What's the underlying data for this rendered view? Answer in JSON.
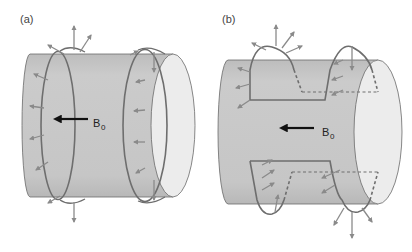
{
  "figure": {
    "panels": [
      {
        "id": "a",
        "label": "(a)",
        "field_label": "B",
        "field_subscript": "0",
        "description": "Cylinder with two circular (saddle-free) loop coils; outward-pointing field arrows around loops"
      },
      {
        "id": "b",
        "label": "(b)",
        "field_label": "B",
        "field_subscript": "0",
        "description": "Cylinder with saddle coil geometry; dashed segments indicate hidden wire paths"
      }
    ],
    "colors": {
      "cylinder_body": "#c8c8c8",
      "cylinder_end": "#ececec",
      "outline": "#6a6a6a",
      "coil": "#6e6e6e",
      "field_arrow": "#8a8a8a",
      "b0_arrow": "#111111"
    }
  }
}
